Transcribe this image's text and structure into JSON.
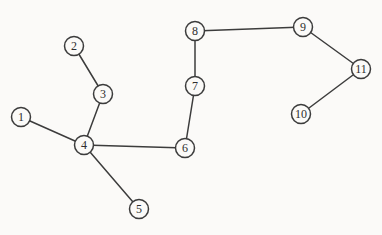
{
  "figure": {
    "type": "graph-diagram",
    "width": 382,
    "height": 235
  },
  "colors": {
    "background": "#fbfaf8",
    "stroke": "#3c3c3c",
    "node_fill": "#fbfaf8",
    "label_text": "#2e2e2e"
  },
  "graph": {
    "node_radius": 9.5,
    "nodes": [
      {
        "id": "1",
        "label": "1",
        "x": 21,
        "y": 117
      },
      {
        "id": "2",
        "label": "2",
        "x": 74,
        "y": 46
      },
      {
        "id": "3",
        "label": "3",
        "x": 103,
        "y": 94
      },
      {
        "id": "4",
        "label": "4",
        "x": 84,
        "y": 145
      },
      {
        "id": "5",
        "label": "5",
        "x": 139,
        "y": 209
      },
      {
        "id": "6",
        "label": "6",
        "x": 185,
        "y": 148
      },
      {
        "id": "7",
        "label": "7",
        "x": 195,
        "y": 86
      },
      {
        "id": "8",
        "label": "8",
        "x": 195,
        "y": 31
      },
      {
        "id": "9",
        "label": "9",
        "x": 303,
        "y": 27
      },
      {
        "id": "10",
        "label": "10",
        "x": 301,
        "y": 114
      },
      {
        "id": "11",
        "label": "11",
        "x": 361,
        "y": 69
      }
    ],
    "edges": [
      {
        "from": "1",
        "to": "4"
      },
      {
        "from": "2",
        "to": "3"
      },
      {
        "from": "3",
        "to": "4"
      },
      {
        "from": "4",
        "to": "5"
      },
      {
        "from": "4",
        "to": "6"
      },
      {
        "from": "6",
        "to": "7"
      },
      {
        "from": "7",
        "to": "8"
      },
      {
        "from": "8",
        "to": "9"
      },
      {
        "from": "9",
        "to": "11"
      },
      {
        "from": "10",
        "to": "11"
      }
    ]
  }
}
